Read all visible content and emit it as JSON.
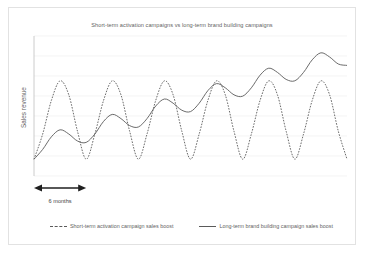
{
  "chart_data": {
    "type": "line",
    "title": "Short-term activation campaigns vs long-term brand building campaigns",
    "xlabel": "",
    "ylabel": "Sales revenue",
    "grid": true,
    "gridlines": 7,
    "legend_position": "bottom",
    "xlim": [
      0,
      36
    ],
    "ylim": [
      0,
      10
    ],
    "annotations": [
      {
        "name": "period-arrow",
        "label": "6 months",
        "type": "double-headed-arrow",
        "x_start": 0,
        "x_end": 6
      }
    ],
    "series": [
      {
        "name": "Short-term activation campaign sales boost",
        "style": "dashed",
        "color": "#5a5a5a",
        "description": "High amplitude oscillation with flat underlying trend; peaks and troughs repeat at the same level across six 6-month cycles.",
        "amplitude": 3.4,
        "period_months": 6,
        "trend_slope": 0.0,
        "baseline": 1.2,
        "x": [
          0,
          1,
          2,
          3,
          4,
          5,
          6,
          7,
          8,
          9,
          10,
          11,
          12,
          13,
          14,
          15,
          16,
          17,
          18,
          19,
          20,
          21,
          22,
          23,
          24,
          25,
          26,
          27,
          28,
          29,
          30,
          31,
          32,
          33,
          34,
          35,
          36
        ],
        "values": [
          1.2,
          3.0,
          5.4,
          6.8,
          5.8,
          3.2,
          1.2,
          3.0,
          5.4,
          6.8,
          5.8,
          3.2,
          1.2,
          3.0,
          5.4,
          6.8,
          5.8,
          3.2,
          1.2,
          3.0,
          5.4,
          6.8,
          5.8,
          3.2,
          1.2,
          3.0,
          5.4,
          6.8,
          5.8,
          3.2,
          1.2,
          3.0,
          5.4,
          6.8,
          5.8,
          3.2,
          1.2
        ]
      },
      {
        "name": "Long-term brand building campaign sales boost",
        "style": "solid",
        "color": "#5a5a5a",
        "description": "Lower amplitude oscillation superimposed on a steadily rising trend line; each successive peak and trough is higher than the last.",
        "amplitude": 1.1,
        "period_months": 6,
        "trend_slope": 0.17,
        "baseline": 1.2,
        "x": [
          0,
          1,
          2,
          3,
          4,
          5,
          6,
          7,
          8,
          9,
          10,
          11,
          12,
          13,
          14,
          15,
          16,
          17,
          18,
          19,
          20,
          21,
          22,
          23,
          24,
          25,
          26,
          27,
          28,
          29,
          30,
          31,
          32,
          33,
          34,
          35,
          36
        ],
        "values": [
          1.2,
          1.9,
          2.8,
          3.3,
          3.0,
          2.5,
          2.4,
          3.0,
          3.9,
          4.4,
          4.1,
          3.6,
          3.5,
          4.1,
          5.0,
          5.5,
          5.2,
          4.7,
          4.6,
          5.2,
          6.1,
          6.6,
          6.3,
          5.8,
          5.7,
          6.3,
          7.2,
          7.7,
          7.4,
          6.9,
          6.8,
          7.4,
          8.3,
          8.8,
          8.5,
          8.0,
          7.9
        ]
      }
    ]
  },
  "legend": {
    "entries": [
      {
        "label": "Short-term activation campaign sales boost",
        "style": "dashed"
      },
      {
        "label": "Long-term brand building campaign sales boost",
        "style": "solid"
      }
    ]
  }
}
